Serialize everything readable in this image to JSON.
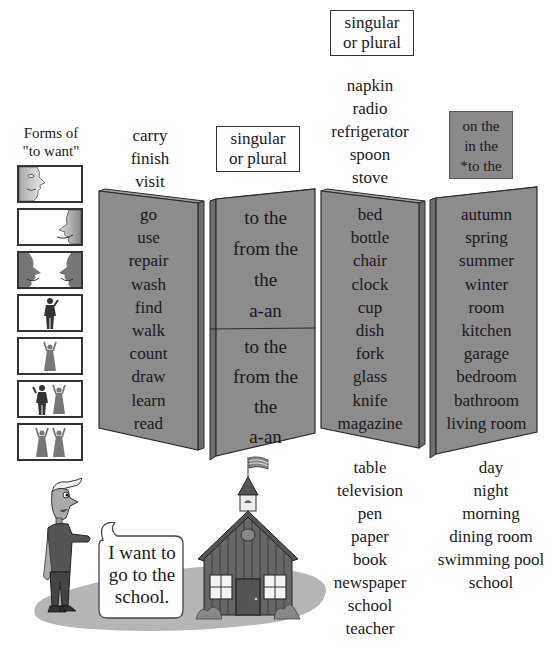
{
  "colors": {
    "panel_face": "#8c8c8c",
    "panel_side": "#6e6e6e",
    "panel_edge": "#2a2a2a",
    "label_box_dark": "#8a8a8a",
    "ground": "#b5b5b5",
    "text": "#1a1a1a"
  },
  "forms_of_want": {
    "title_line1": "Forms of",
    "title_line2": "\"to want\"",
    "icons": [
      {
        "name": "face-left-profile-icon",
        "dark": false
      },
      {
        "name": "face-right-profile-icon",
        "dark": false
      },
      {
        "name": "two-faces-talking-icon",
        "dark": true
      },
      {
        "name": "man-figure-icon",
        "dark": false
      },
      {
        "name": "woman-figure-icon",
        "dark": false
      },
      {
        "name": "man-and-woman-icon",
        "dark": false
      },
      {
        "name": "two-women-icon",
        "dark": false
      }
    ]
  },
  "verbs": {
    "above": [
      "carry",
      "finish",
      "visit"
    ],
    "panel": [
      "go",
      "use",
      "repair",
      "wash",
      "find",
      "walk",
      "count",
      "draw",
      "learn",
      "read"
    ]
  },
  "articles": {
    "label_line1": "singular",
    "label_line2": "or plural",
    "top": [
      "to the",
      "from the",
      "the",
      "a-an"
    ],
    "bottom": [
      "to the",
      "from the",
      "the",
      "a-an"
    ]
  },
  "nouns": {
    "label_line1": "singular",
    "label_line2": "or plural",
    "above": [
      "napkin",
      "radio",
      "refrigerator",
      "spoon",
      "stove"
    ],
    "panel": [
      "bed",
      "bottle",
      "chair",
      "clock",
      "cup",
      "dish",
      "fork",
      "glass",
      "knife",
      "magazine"
    ],
    "below": [
      "table",
      "television",
      "pen",
      "paper",
      "book",
      "newspaper",
      "school",
      "teacher"
    ]
  },
  "places": {
    "prepositions": [
      "on the",
      "in the",
      "*to the"
    ],
    "panel": [
      "autumn",
      "spring",
      "summer",
      "winter",
      "room",
      "kitchen",
      "garage",
      "bedroom",
      "bathroom",
      "living room"
    ],
    "below": [
      "day",
      "night",
      "morning",
      "dining room",
      "swimming pool",
      "school"
    ]
  },
  "scene": {
    "speech_line1": "I want to",
    "speech_line2": "go to the",
    "speech_line3": "school."
  }
}
